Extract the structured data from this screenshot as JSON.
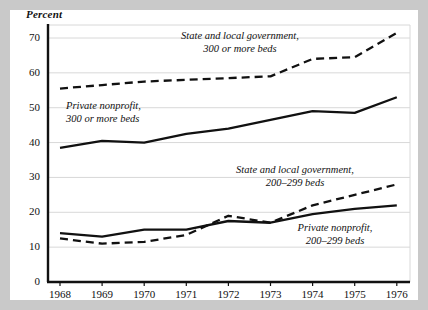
{
  "figure": {
    "ylabel": "Percent",
    "frame_color": "#c9c9c9",
    "plot_background": "#ffffff",
    "line_color": "#111111",
    "grid_color": "#d8d8d8"
  },
  "annotations": [
    {
      "id": "state-local-300",
      "line1": "State and local government,",
      "line2": "300 or more beds"
    },
    {
      "id": "private-300",
      "line1": "Private nonprofit,",
      "line2": "300 or more beds"
    },
    {
      "id": "state-local-200",
      "line1": "State and local government,",
      "line2": "200–299 beds"
    },
    {
      "id": "private-200",
      "line1": "Private nonprofit,",
      "line2": "200–299 beds"
    }
  ],
  "chart_data": {
    "type": "line",
    "title": "",
    "xlabel": "",
    "ylabel": "Percent",
    "x": [
      1968,
      1969,
      1970,
      1971,
      1972,
      1973,
      1974,
      1975,
      1976
    ],
    "categories": [
      "1968",
      "1969",
      "1970",
      "1971",
      "1972",
      "1973",
      "1974",
      "1975",
      "1976"
    ],
    "yticks": [
      0,
      10,
      20,
      30,
      40,
      50,
      60,
      70
    ],
    "ylim": [
      0,
      74
    ],
    "xlim": [
      1967.7,
      1976.4
    ],
    "grid": true,
    "legend": "inline-annotations",
    "series": [
      {
        "name": "State and local government, 300 or more beds",
        "style": "dashed",
        "values": [
          55.5,
          56.5,
          57.5,
          58.0,
          58.5,
          59.0,
          64.0,
          64.5,
          71.5
        ]
      },
      {
        "name": "Private nonprofit, 300 or more beds",
        "style": "solid",
        "values": [
          38.5,
          40.5,
          40.0,
          42.5,
          44.0,
          46.5,
          49.0,
          48.5,
          53.0
        ]
      },
      {
        "name": "State and local government, 200–299 beds",
        "style": "dashed",
        "values": [
          12.5,
          11.0,
          11.5,
          13.5,
          19.0,
          17.0,
          22.0,
          25.0,
          28.0
        ]
      },
      {
        "name": "Private nonprofit, 200–299 beds",
        "style": "solid",
        "values": [
          14.0,
          13.0,
          15.0,
          15.0,
          17.5,
          17.0,
          19.5,
          21.0,
          22.0
        ]
      }
    ]
  }
}
